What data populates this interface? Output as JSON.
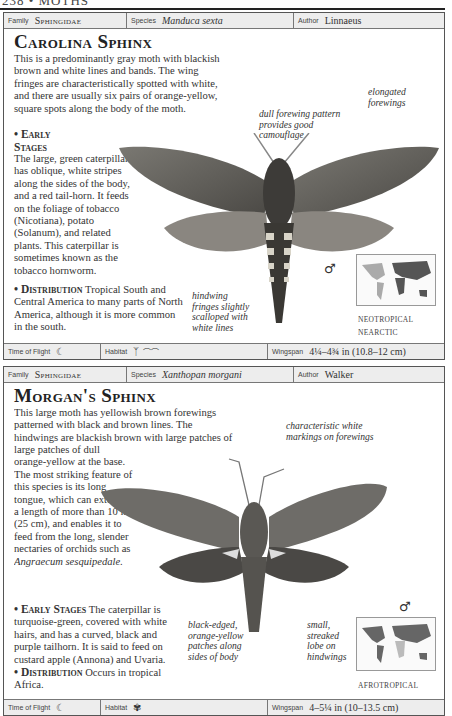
{
  "page_header": {
    "number": "238",
    "section": "MOTHS",
    "text": "238 • MOTHS"
  },
  "cards": [
    {
      "family_label": "Family",
      "family": "Sphingidae",
      "species_label": "Species",
      "species": "Manduca sexta",
      "author_label": "Author",
      "author": "Linnaeus",
      "title": "Carolina Sphinx",
      "intro": "This is a predominantly gray moth with blackish brown and white lines and bands. The wing fringes are characteristically spotted with white, and there are usually six pairs of orange-yellow, square spots along the body of the moth.",
      "early_stages_heading": "• Early Stages",
      "early_stages": "The large, green caterpillar has oblique, white stripes along the sides of the body, and a red tail-horn. It feeds on the foliage of tobacco (Nicotiana), potato (Solanum), and related plants. This caterpillar is sometimes known as the tobacco hornworm.",
      "distribution_heading": "• Distribution",
      "distribution": "Tropical South and Central America to many parts of North America, although it is more common in the south.",
      "annotations": [
        "dull forewing pattern provides good camouflage",
        "elongated forewings",
        "hindwing fringes slightly scalloped with white lines"
      ],
      "sex_symbol": "♂",
      "map_regions": [
        "NEOTROPICAL",
        "NEARCTIC"
      ],
      "time_of_flight_label": "Time of Flight",
      "time_of_flight_icon": "crescent-moon-icon",
      "habitat_label": "Habitat",
      "habitat_icons": [
        "grass-plant-icon",
        "farmland-icon"
      ],
      "wingspan_label": "Wingspan",
      "wingspan": "4¼–4¾ in (10.8–12 cm)"
    },
    {
      "family_label": "Family",
      "family": "Sphingidae",
      "species_label": "Species",
      "species": "Xanthopan morgani",
      "author_label": "Author",
      "author": "Walker",
      "title": "Morgan's Sphinx",
      "intro": "This large moth has yellowish brown forewings patterned with black and brown lines. The hindwings are blackish brown with large patches of dull orange-yellow at the base. The most striking feature of this species is its long tongue, which can extend to a length of more than 10 in (25 cm), and enables it to feed from the long, slender nectaries of orchids such as Angraecum sesquipedale.",
      "early_stages_heading": "• Early Stages",
      "early_stages": "The caterpillar is turquoise-green, covered with white hairs, and has a curved, black and purple tailhorn. It is said to feed on custard apple (Annona) and Uvaria.",
      "distribution_heading": "• Distribution",
      "distribution": "Occurs in tropical Africa.",
      "annotations": [
        "characteristic white markings on forewings",
        "black-edged, orange-yellow patches along sides of body",
        "small, streaked lobe on hindwings"
      ],
      "sex_symbol": "♂",
      "map_regions": [
        "AFROTROPICAL"
      ],
      "time_of_flight_label": "Time of Flight",
      "time_of_flight_icon": "crescent-moon-icon",
      "habitat_label": "Habitat",
      "habitat_icons": [
        "palm-tree-icon"
      ],
      "wingspan_label": "Wingspan",
      "wingspan": "4–5¼ in (10–13.5 cm)"
    }
  ]
}
